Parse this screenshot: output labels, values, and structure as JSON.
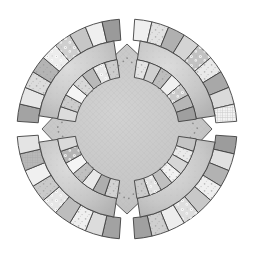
{
  "artwork": {
    "title": "Double Wedding Ring Quilt Block",
    "type": "quilt-block-diagram",
    "canvas": {
      "width": 254,
      "height": 264,
      "background": "#ffffff"
    },
    "circle": {
      "cx": 127,
      "cy": 129,
      "radius": 110
    },
    "palette": {
      "outline": "#3f3f3f",
      "seam": "#ffffff",
      "center_fill": "#c6c6c6",
      "lens_fill": "#c9c9c9",
      "stitch_dot": "#8a8a8a",
      "tone_darkest": "#8f8f8f",
      "tone_dark": "#a6a6a6",
      "tone_mid": "#bcbcbc",
      "tone_light": "#d6d6d6",
      "tone_lightest": "#efefef",
      "tone_white": "#f8f8f8"
    },
    "structure": {
      "quadrants": 4,
      "quadrant_names": [
        "top-left",
        "top-right",
        "bottom-right",
        "bottom-left"
      ],
      "outer_arc_patch_count": 9,
      "inner_arc_patch_count": 7,
      "center_shape": "concave-diamond / astroid",
      "center_stitch": "dotted outline",
      "cardinal_gap": "white wedge seam at N, E, S, W"
    }
  },
  "chart_data": {
    "type": "pie",
    "title": "Double Wedding Ring Quilt Block",
    "xlabel": "",
    "ylabel": "",
    "grid": false,
    "legend": "none",
    "categories": [
      "top-left",
      "top-right",
      "bottom-right",
      "bottom-left"
    ],
    "values": [
      25,
      25,
      25,
      25
    ],
    "rings": [
      {
        "quadrant": "top-left",
        "start_angle_deg": 184,
        "end_angle_deg": 266,
        "outer": [
          {
            "i": 0,
            "fill": "#a3a3a3",
            "texture": "solid"
          },
          {
            "i": 1,
            "fill": "#e6e6e6",
            "texture": "solid"
          },
          {
            "i": 2,
            "fill": "#dcdcdc",
            "texture": "speckle"
          },
          {
            "i": 3,
            "fill": "#b4b4b4",
            "texture": "speckle"
          },
          {
            "i": 4,
            "fill": "#ededed",
            "texture": "floral"
          },
          {
            "i": 5,
            "fill": "#cfcfcf",
            "texture": "floral"
          },
          {
            "i": 6,
            "fill": "#c6c6c6",
            "texture": "solid"
          },
          {
            "i": 7,
            "fill": "#efefef",
            "texture": "solid"
          },
          {
            "i": 8,
            "fill": "#9a9a9a",
            "texture": "solid"
          }
        ],
        "inner": [
          {
            "i": 0,
            "fill": "#dcdcdc",
            "texture": "solid"
          },
          {
            "i": 1,
            "fill": "#cccccc",
            "texture": "speckle"
          },
          {
            "i": 2,
            "fill": "#f4f4f4",
            "texture": "solid"
          },
          {
            "i": 3,
            "fill": "#d8d8d8",
            "texture": "speckle"
          },
          {
            "i": 4,
            "fill": "#b9b9b9",
            "texture": "solid"
          },
          {
            "i": 5,
            "fill": "#e8e8e8",
            "texture": "floral"
          },
          {
            "i": 6,
            "fill": "#cdcdcd",
            "texture": "speckle"
          }
        ]
      },
      {
        "quadrant": "top-right",
        "start_angle_deg": 274,
        "end_angle_deg": 356,
        "outer": [
          {
            "i": 0,
            "fill": "#efefef",
            "texture": "solid"
          },
          {
            "i": 1,
            "fill": "#e2e2e2",
            "texture": "speckle"
          },
          {
            "i": 2,
            "fill": "#b0b0b0",
            "texture": "solid"
          },
          {
            "i": 3,
            "fill": "#d4d4d4",
            "texture": "solid"
          },
          {
            "i": 4,
            "fill": "#c2c2c2",
            "texture": "floral"
          },
          {
            "i": 5,
            "fill": "#e9e9e9",
            "texture": "speckle"
          },
          {
            "i": 6,
            "fill": "#a8a8a8",
            "texture": "solid"
          },
          {
            "i": 7,
            "fill": "#dadada",
            "texture": "solid"
          },
          {
            "i": 8,
            "fill": "#f2f2f2",
            "texture": "grid"
          }
        ],
        "inner": [
          {
            "i": 0,
            "fill": "#e4e4e4",
            "texture": "speckle"
          },
          {
            "i": 1,
            "fill": "#d0d0d0",
            "texture": "solid"
          },
          {
            "i": 2,
            "fill": "#bdbdbd",
            "texture": "speckle"
          },
          {
            "i": 3,
            "fill": "#f0f0f0",
            "texture": "solid"
          },
          {
            "i": 4,
            "fill": "#cacaca",
            "texture": "floral"
          },
          {
            "i": 5,
            "fill": "#b6b6b6",
            "texture": "solid"
          },
          {
            "i": 6,
            "fill": "#9f9f9f",
            "texture": "solid"
          }
        ]
      },
      {
        "quadrant": "bottom-right",
        "start_angle_deg": 4,
        "end_angle_deg": 86,
        "outer": [
          {
            "i": 0,
            "fill": "#9c9c9c",
            "texture": "solid"
          },
          {
            "i": 1,
            "fill": "#e0e0e0",
            "texture": "solid"
          },
          {
            "i": 2,
            "fill": "#b2b2b2",
            "texture": "solid"
          },
          {
            "i": 3,
            "fill": "#efefef",
            "texture": "speckle"
          },
          {
            "i": 4,
            "fill": "#c8c8c8",
            "texture": "solid"
          },
          {
            "i": 5,
            "fill": "#dedede",
            "texture": "floral"
          },
          {
            "i": 6,
            "fill": "#ededed",
            "texture": "solid"
          },
          {
            "i": 7,
            "fill": "#cfcfcf",
            "texture": "speckle"
          },
          {
            "i": 8,
            "fill": "#a0a0a0",
            "texture": "solid"
          }
        ],
        "inner": [
          {
            "i": 0,
            "fill": "#c4c4c4",
            "texture": "solid"
          },
          {
            "i": 1,
            "fill": "#eaeaea",
            "texture": "speckle"
          },
          {
            "i": 2,
            "fill": "#d6d6d6",
            "texture": "solid"
          },
          {
            "i": 3,
            "fill": "#f2f2f2",
            "texture": "speckle"
          },
          {
            "i": 4,
            "fill": "#bfbfbf",
            "texture": "solid"
          },
          {
            "i": 5,
            "fill": "#e2e2e2",
            "texture": "floral"
          },
          {
            "i": 6,
            "fill": "#cbcbcb",
            "texture": "speckle"
          }
        ]
      },
      {
        "quadrant": "bottom-left",
        "start_angle_deg": 94,
        "end_angle_deg": 176,
        "outer": [
          {
            "i": 0,
            "fill": "#a2a2a2",
            "texture": "solid"
          },
          {
            "i": 1,
            "fill": "#dcdcdc",
            "texture": "solid"
          },
          {
            "i": 2,
            "fill": "#efefef",
            "texture": "speckle"
          },
          {
            "i": 3,
            "fill": "#bdbdbd",
            "texture": "solid"
          },
          {
            "i": 4,
            "fill": "#e6e6e6",
            "texture": "floral"
          },
          {
            "i": 5,
            "fill": "#cacaca",
            "texture": "speckle"
          },
          {
            "i": 6,
            "fill": "#f0f0f0",
            "texture": "solid"
          },
          {
            "i": 7,
            "fill": "#b8b8b8",
            "texture": "grid"
          },
          {
            "i": 8,
            "fill": "#e4e4e4",
            "texture": "solid"
          }
        ],
        "inner": [
          {
            "i": 0,
            "fill": "#d2d2d2",
            "texture": "speckle"
          },
          {
            "i": 1,
            "fill": "#aeaeae",
            "texture": "solid"
          },
          {
            "i": 2,
            "fill": "#e8e8e8",
            "texture": "solid"
          },
          {
            "i": 3,
            "fill": "#c0c0c0",
            "texture": "speckle"
          },
          {
            "i": 4,
            "fill": "#f4f4f4",
            "texture": "solid"
          },
          {
            "i": 5,
            "fill": "#b4b4b4",
            "texture": "floral"
          },
          {
            "i": 6,
            "fill": "#dadada",
            "texture": "solid"
          }
        ]
      }
    ]
  }
}
